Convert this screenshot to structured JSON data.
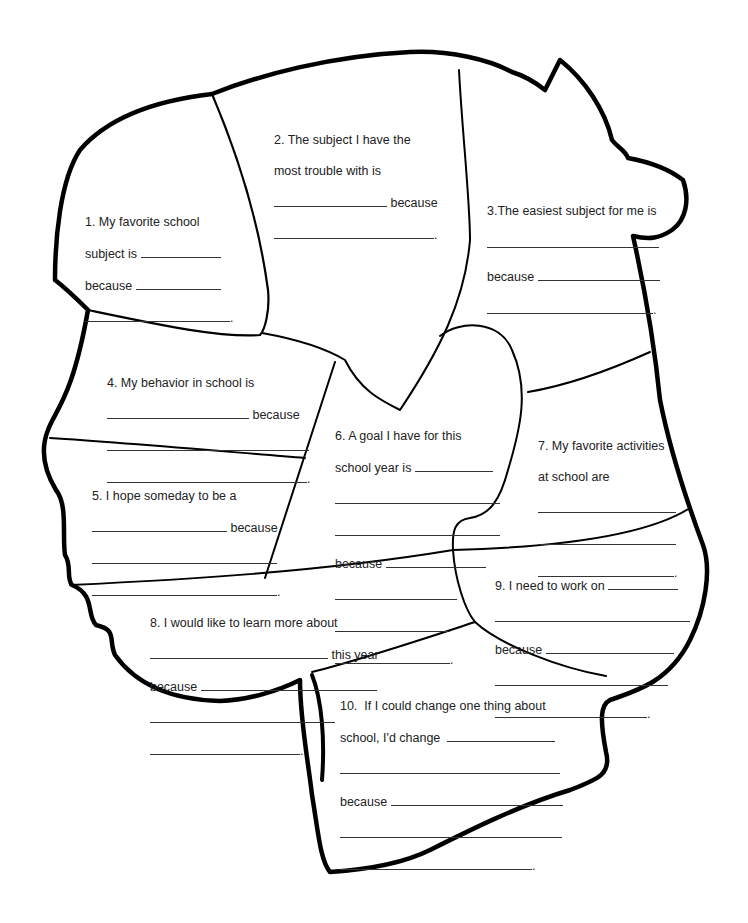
{
  "worksheet": {
    "sections": [
      {
        "id": 1,
        "lines": [
          "1. My favorite school",
          "subject is",
          "because"
        ]
      },
      {
        "id": 2,
        "lines": [
          "2. The subject I have the",
          "most trouble with is",
          "because"
        ]
      },
      {
        "id": 3,
        "lines": [
          "3.The easiest subject for me is",
          "because"
        ]
      },
      {
        "id": 4,
        "lines": [
          "4. My behavior in school is",
          "because"
        ]
      },
      {
        "id": 5,
        "lines": [
          "5. I hope someday to be a",
          "because"
        ]
      },
      {
        "id": 6,
        "lines": [
          "6. A goal I have for this",
          "school year is",
          "because"
        ]
      },
      {
        "id": 7,
        "lines": [
          "7. My favorite activities",
          "at school are"
        ]
      },
      {
        "id": 8,
        "lines": [
          "8. I would like to learn more about",
          "this year",
          "because"
        ]
      },
      {
        "id": 9,
        "lines": [
          "9. I need to work on",
          "because"
        ]
      },
      {
        "id": 10,
        "lines": [
          "10.  If I could change one thing about",
          "school, I'd change",
          "because"
        ]
      }
    ],
    "period": ".",
    "colors": {
      "outline": "#000000",
      "text": "#222222",
      "background": "#ffffff"
    }
  }
}
